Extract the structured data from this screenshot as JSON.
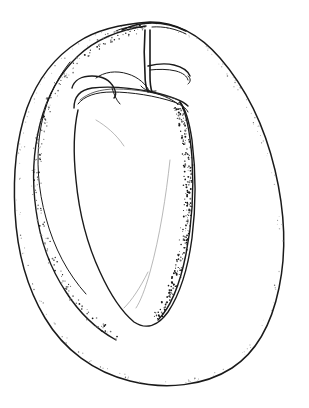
{
  "figure": {
    "title": "Pepper fruit enclosed in outer husk",
    "medium": "pen-and-ink line drawing with stipple shading",
    "background_color": "#ffffff",
    "ink_color": "#1a1a1a",
    "canvas": {
      "width": 309,
      "height": 408
    },
    "caption": "",
    "labels": [],
    "annotations": []
  },
  "parts": [
    {
      "id": "outer-husk",
      "name": "Outer husk outline",
      "description": "Large ovoid papery envelope surrounding the fruit"
    },
    {
      "id": "husk-inner-fold",
      "name": "Husk inner fold",
      "description": "Secondary contour inside the husk wall on the left"
    },
    {
      "id": "inner-fruit",
      "name": "Inner pepper fruit",
      "description": "Conical tapering fruit body inside the husk"
    },
    {
      "id": "calyx",
      "name": "Calyx and sepals",
      "description": "Ribbed collar at the top of the fruit"
    },
    {
      "id": "pedicel",
      "name": "Stem / pedicel",
      "description": "Vertical stalk rising from the calyx through the husk apex"
    },
    {
      "id": "side-branch",
      "name": "Lateral stem branch",
      "description": "Hooked branch curving to the right of the pedicel"
    },
    {
      "id": "shading-right",
      "name": "Right-side stipple shading",
      "description": "Dense stipple along the right flank of the fruit"
    },
    {
      "id": "shading-left",
      "name": "Left-side stipple shading",
      "description": "Dense stipple along the left inner husk wall"
    },
    {
      "id": "shading-husk",
      "name": "Husk rim stipple",
      "description": "Sparse pale stipple tracing the outer husk rim"
    }
  ],
  "geometry": {
    "outer_husk_path": "M 150 22 C 120 24 96 30 78 42 C 56 56 38 78 27 108 C 16 140 13 178 15 212 C 17 250 27 288 45 318 C 64 350 94 372 130 381 C 166 390 204 386 232 368 C 258 351 272 322 279 288 C 287 250 284 208 275 170 C 265 128 246 88 220 58 C 200 35 176 22 150 22 Z",
    "husk_fold_path": "M 146 26 C 118 30 95 40 78 56 C 60 73 47 96 40 124 C 33 152 32 182 36 210 C 40 240 50 268 66 292 C 80 314 98 330 116 340",
    "husk_fold2_path": "M 70 62 C 54 82 44 106 40 132 C 36 160 38 190 46 218 C 54 248 68 274 86 294",
    "inner_fruit_path": "M 78 110 C 74 128 73 152 76 180 C 79 212 87 244 100 272 C 110 294 122 312 134 322 C 146 330 158 326 168 312 C 180 294 188 268 192 238 C 196 206 196 172 192 140 C 189 120 185 108 180 102",
    "fruit_right_path": "M 180 102 C 186 112 190 132 192 158 C 194 190 192 224 186 254 C 180 284 170 308 158 320",
    "calyx_outer_path": "M 74 108 C 74 96 80 90 92 88 C 110 86 132 88 152 92 C 170 96 182 100 188 106",
    "calyx_band_path": "M 78 104 C 84 96 96 92 112 92 C 132 92 156 96 174 102 C 182 105 186 108 188 112",
    "calyx_band2_path": "M 80 100 C 88 93 100 89 116 89 C 136 89 158 93 176 99",
    "sepal_path": "M 72 88 C 74 80 82 76 92 76 C 102 76 110 80 114 88 C 116 92 116 96 114 98",
    "sepal2_path": "M 96 78 C 104 72 116 70 128 74 C 138 77 146 84 150 92",
    "pedicel_path": "M 145 30 C 144 44 144 60 145 74 C 145 82 146 88 148 92",
    "pedicel2_path": "M 150 30 C 150 46 150 62 150 76 C 150 84 151 89 152 92",
    "branch_path": "M 148 66 C 156 64 166 63 174 65 C 182 67 188 71 190 76",
    "branch2_path": "M 150 70 C 158 69 168 69 176 71 C 183 73 187 76 188 80",
    "apex_path": "M 122 30 C 132 25 142 23 152 23 C 164 23 176 26 186 31"
  },
  "stipple": {
    "right_flank_count": 260,
    "left_wall_count": 210,
    "husk_rim_count": 150,
    "seed": 7
  },
  "colors": {
    "background": "#ffffff",
    "ink": "#1a1a1a",
    "ink_soft": "#3a3a3a",
    "ink_faint": "#9a9a9a",
    "stipple_dark": "#161616",
    "stipple_mid": "#6e6e6e",
    "stipple_light": "#b4b4b4"
  }
}
